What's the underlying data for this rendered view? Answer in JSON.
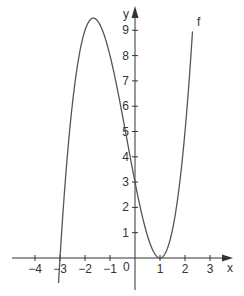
{
  "chart_data": {
    "type": "line",
    "title": "",
    "xlabel": "x",
    "ylabel": "y",
    "function_label": "f",
    "function": "f(x) = (x - 1)^2 (x + 3)",
    "xlim": [
      -4.9,
      3.9
    ],
    "ylim": [
      -1.3,
      9.9
    ],
    "x_ticks": [
      -4,
      -3,
      -2,
      -1,
      1,
      2,
      3
    ],
    "x_tick_labels": [
      "−4",
      "−3",
      "−2",
      "−1",
      "1",
      "2",
      "3"
    ],
    "y_ticks": [
      1,
      2,
      3,
      4,
      5,
      6,
      7,
      8,
      9
    ],
    "y_tick_labels": [
      "1",
      "2",
      "3",
      "4",
      "5",
      "6",
      "7",
      "8",
      "9"
    ],
    "origin_label": "0",
    "grid": false,
    "key_points": [
      {
        "x": -3,
        "y": 0,
        "note": "root"
      },
      {
        "x": -1.67,
        "y": 9.48,
        "note": "local maximum"
      },
      {
        "x": 0,
        "y": 3,
        "note": "y-intercept"
      },
      {
        "x": 1,
        "y": 0,
        "note": "double root / local minimum"
      }
    ],
    "series": [
      {
        "name": "f",
        "x": [
          -3.05,
          -3.0,
          -2.75,
          -2.5,
          -2.25,
          -2.0,
          -1.75,
          -1.67,
          -1.5,
          -1.25,
          -1.0,
          -0.75,
          -0.5,
          -0.25,
          0.0,
          0.25,
          0.5,
          0.75,
          1.0,
          1.25,
          1.5,
          1.75,
          2.0,
          2.25
        ],
        "y": [
          -0.83,
          0.0,
          1.95,
          6.13,
          7.92,
          9.0,
          9.45,
          9.48,
          9.38,
          8.86,
          8.0,
          6.89,
          5.63,
          4.3,
          3.0,
          1.83,
          0.88,
          0.23,
          0.0,
          0.27,
          1.13,
          2.67,
          5.0,
          8.2
        ]
      }
    ]
  },
  "colors": {
    "axis": "#333333",
    "curve": "#555555",
    "text": "#333333"
  }
}
